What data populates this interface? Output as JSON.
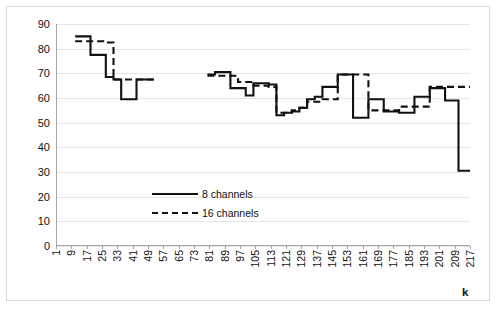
{
  "chart_data": {
    "type": "line",
    "title": "",
    "xlabel": "k",
    "ylabel": "Percentage of zeros, %",
    "ylim": [
      0,
      90
    ],
    "xlim": [
      1,
      217
    ],
    "ytick_step": 10,
    "xtick_step": 8,
    "grid": true,
    "legend_position": "center",
    "yticks": [
      0,
      10,
      20,
      30,
      40,
      50,
      60,
      70,
      80,
      90
    ],
    "xticks": [
      1,
      9,
      17,
      25,
      33,
      41,
      49,
      57,
      65,
      73,
      81,
      89,
      97,
      105,
      113,
      121,
      129,
      137,
      145,
      153,
      161,
      169,
      177,
      185,
      193,
      201,
      209,
      217
    ],
    "series": [
      {
        "name": "8 channels",
        "style": "solid",
        "color": "#111111",
        "segments": [
          {
            "x": [
              11,
              15,
              19,
              23,
              27,
              31,
              35,
              39,
              43,
              47,
              52
            ],
            "y": [
              85,
              85,
              77.5,
              77.5,
              68.5,
              67.5,
              59.5,
              59.5,
              67.5,
              67.5,
              67.5
            ]
          },
          {
            "x": [
              80,
              84,
              88,
              92,
              96,
              100,
              104,
              108,
              112,
              116,
              120,
              124,
              128,
              132,
              136,
              140,
              144,
              148,
              152,
              156,
              160,
              164,
              168,
              172,
              176,
              180,
              184,
              188,
              192,
              196,
              200,
              204,
              208,
              211,
              215,
              217
            ],
            "y": [
              69.5,
              70.5,
              70.5,
              64,
              64,
              61,
              66,
              66,
              65.5,
              53,
              54,
              54.5,
              56,
              59.5,
              60.5,
              64.5,
              64.5,
              69.5,
              69.5,
              52,
              52,
              59.5,
              59.5,
              54.5,
              54.5,
              54,
              54,
              60.5,
              60.5,
              64,
              64,
              59,
              59,
              30.5,
              30.5,
              30.5
            ]
          }
        ]
      },
      {
        "name": "16 channels",
        "style": "dashed",
        "color": "#111111",
        "segments": [
          {
            "x": [
              11,
              15,
              19,
              23,
              27,
              31,
              35,
              39,
              43,
              47,
              52
            ],
            "y": [
              83,
              83,
              83,
              83,
              82.5,
              67.5,
              67.5,
              67.5,
              67.5,
              67.5,
              67.5
            ]
          },
          {
            "x": [
              80,
              84,
              88,
              92,
              96,
              100,
              104,
              108,
              112,
              116,
              120,
              124,
              128,
              132,
              136,
              140,
              144,
              148,
              152,
              156,
              160,
              164,
              168,
              172,
              176,
              180,
              184,
              188,
              192,
              196,
              200,
              204,
              208,
              212,
              217
            ],
            "y": [
              69,
              69,
              69,
              69,
              66.5,
              66.5,
              65,
              65,
              64.5,
              54,
              54,
              55,
              56,
              58.5,
              58.5,
              59.5,
              59.5,
              69.5,
              69.5,
              69.5,
              69.5,
              55,
              55,
              55,
              55,
              56.5,
              56.5,
              56.5,
              56.5,
              64.5,
              64.5,
              64.5,
              64.5,
              64.5,
              64.5
            ]
          }
        ]
      }
    ]
  },
  "legend": {
    "items": [
      {
        "label": "8 channels",
        "style": "solid"
      },
      {
        "label": "16 channels",
        "style": "dashed"
      }
    ]
  }
}
